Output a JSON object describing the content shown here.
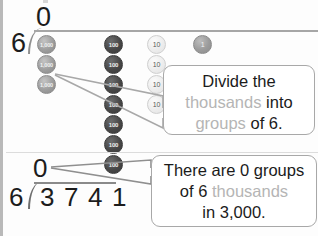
{
  "worksheet": {
    "upper_division": {
      "quotient": "0",
      "divisor": "6",
      "place_columns": [
        {
          "place": "thousands",
          "disk_label": "1,000",
          "count": 3,
          "style": "thousand"
        },
        {
          "place": "hundreds",
          "disk_label": "100",
          "count": 7,
          "style": "hundred"
        },
        {
          "place": "tens",
          "disk_label": "10",
          "count": 4,
          "style": "ten"
        },
        {
          "place": "ones",
          "disk_label": "1",
          "count": 1,
          "style": "one"
        }
      ]
    },
    "callout_divide": {
      "line1_plain": "Divide the",
      "line2_gray": "thousands",
      "line2_plain": " into",
      "line3_gray": "groups",
      "line3_plain": " of 6."
    },
    "callout_groups": {
      "line1_plain": "There are 0 groups",
      "line2_plain": "of 6 ",
      "line2_gray": "thousands",
      "line3_plain": "in 3,000."
    },
    "lower_division": {
      "quotient": "0",
      "divisor": "6",
      "dividend_digits": [
        "3",
        "7",
        "4",
        "1"
      ]
    }
  }
}
